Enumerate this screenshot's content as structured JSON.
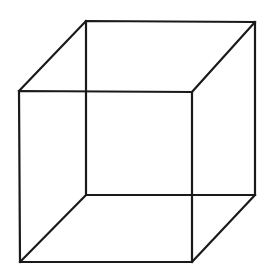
{
  "figure": {
    "name": "Necker cube",
    "type": "line-drawing",
    "canvas": {
      "width": 276,
      "height": 277,
      "background_color": "#ffffff"
    },
    "style": {
      "stroke_color": "#1a1a1a",
      "stroke_width": 2.2,
      "fill": "none"
    },
    "vertices": {
      "back_top_left": {
        "label": "back-top-left",
        "x": 86,
        "y": 21
      },
      "back_top_right": {
        "label": "back-top-right",
        "x": 255,
        "y": 22
      },
      "back_bottom_right": {
        "label": "back-bottom-right",
        "x": 255,
        "y": 195
      },
      "back_bottom_left": {
        "label": "back-bottom-left",
        "x": 86,
        "y": 195
      },
      "front_top_left": {
        "label": "front-top-left",
        "x": 19,
        "y": 91
      },
      "front_top_right": {
        "label": "front-top-right",
        "x": 192,
        "y": 92
      },
      "front_bottom_right": {
        "label": "front-bottom-right",
        "x": 192,
        "y": 262
      },
      "front_bottom_left": {
        "label": "front-bottom-left",
        "x": 20,
        "y": 262
      }
    },
    "faces": {
      "back_square_points": "86,21 255,22 255,195 86,195",
      "front_square_points": "19,91 192,92 192,262 20,262"
    },
    "connectors": [
      {
        "name": "top-left-connector",
        "from": "back_top_left",
        "to": "front_top_left",
        "d": "M 86,21 L 19,91"
      },
      {
        "name": "top-right-connector",
        "from": "back_top_right",
        "to": "front_top_right",
        "d": "M 255,22 L 192,92"
      },
      {
        "name": "bottom-right-connector",
        "from": "back_bottom_right",
        "to": "front_bottom_right",
        "d": "M 255,195 L 192,262"
      },
      {
        "name": "bottom-left-connector",
        "from": "back_bottom_left",
        "to": "front_bottom_left",
        "d": "M 86,195 L 20,262"
      }
    ],
    "counts": {
      "vertices": 8,
      "edges": 12,
      "faces": 6
    }
  }
}
